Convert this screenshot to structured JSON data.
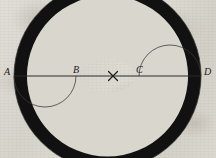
{
  "figure": {
    "kind": "geometric-construction",
    "background_color": "#d9d6ce",
    "ink_color": "#111111",
    "line_color": "#2b2b2b"
  },
  "baseline": {
    "label": "line-AD",
    "y": 76,
    "x_start": 14,
    "x_end": 201
  },
  "points": [
    {
      "id": "A",
      "label": "A",
      "x": 14,
      "y": 76,
      "label_x": 4,
      "label_y": 67
    },
    {
      "id": "B",
      "label": "B",
      "x": 76,
      "y": 76,
      "label_x": 73,
      "label_y": 66
    },
    {
      "id": "C",
      "label": "C",
      "x": 139,
      "y": 76,
      "label_x": 136,
      "label_y": 66
    },
    {
      "id": "D",
      "label": "D",
      "x": 201,
      "y": 76,
      "label_x": 203,
      "label_y": 67
    }
  ],
  "center_mark": {
    "label": "center-cross",
    "glyph": "×",
    "x": 113,
    "y": 76
  },
  "curve": {
    "band_thickness_px": 13,
    "outer_radius": 93,
    "notes": "Large semicircle above AD from A to D, large semicircle below AD from A to D, inner semicircles on AB, BC, CD forming the reversing S spine."
  }
}
